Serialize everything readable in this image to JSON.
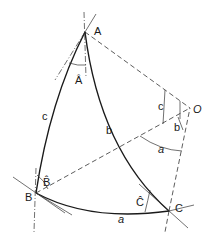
{
  "diagram": {
    "vertices": {
      "A": {
        "label": "A",
        "x": 85,
        "y": 32
      },
      "B": {
        "label": "B",
        "x": 36,
        "y": 193
      },
      "C": {
        "label": "C",
        "x": 169,
        "y": 211
      },
      "O": {
        "label": "O",
        "x": 190,
        "y": 108
      }
    },
    "angle_labels": {
      "A": "Â",
      "B": "B̂",
      "C": "Ĉ"
    },
    "side_labels": {
      "a": "a",
      "b": "b",
      "c": "c"
    },
    "central_angle_labels": {
      "a": "a",
      "b": "b",
      "c": "c"
    }
  }
}
